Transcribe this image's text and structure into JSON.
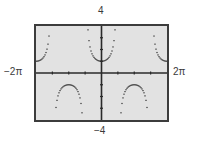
{
  "chart_data": {
    "type": "scatter",
    "title": "",
    "function": "y = sec(x)",
    "xlabel": "",
    "ylabel": "",
    "xlim_labels": [
      "−2π",
      "2π"
    ],
    "ylim_labels": [
      "−4",
      "4"
    ],
    "xlim": [
      -6.2832,
      6.2832
    ],
    "ylim": [
      -4,
      4
    ],
    "xscale": 1.5708,
    "yscale": 1,
    "grid": false,
    "legend": null,
    "style": "graphing-calculator dot plot",
    "colors": {
      "screen_bg": "#e2e2e2",
      "border": "#3c3c3c",
      "axes": "#2a2a2a",
      "points": "#2a2a2a"
    },
    "series": [
      {
        "name": "sec(x)",
        "points_description": "upward U-branches on (-2π,-3π/2), (-π/2,π/2), (3π/2,2π) with minimum y=1; downward ∩-branches on (-3π/2,-π/2) and (π/2,3π/2) with maximum y=-1; clipped at |y|=4"
      }
    ]
  },
  "labels": {
    "ymax": "4",
    "ymin": "−4",
    "xmin": "−2π",
    "xmax": "2π"
  }
}
